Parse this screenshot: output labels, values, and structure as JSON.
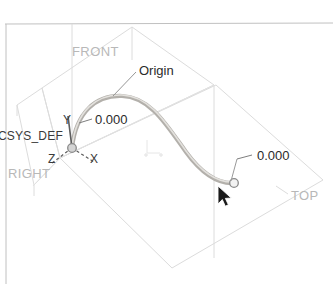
{
  "viewport": {
    "name": "cad-3d-viewport",
    "background_color": "#ffffff",
    "border_color": "#c9c9c9"
  },
  "colors": {
    "datum_plane_line": "#d8d8d8",
    "spline_curve": "#b3b0ab",
    "spline_highlight": "#d9d7d3",
    "leader_line": "#8f8f8f",
    "axis_line": "#6f6f6f",
    "point_marker_fill": "#d0d0d0",
    "point_marker_stroke": "#7a7a7a",
    "plane_label": "#b8b8b8",
    "dark_text": "#2b2b2b",
    "cursor": "#1a1a1a"
  },
  "datum_planes": [
    {
      "name": "FRONT",
      "label": "FRONT",
      "label_x": 72,
      "label_y": 44
    },
    {
      "name": "RIGHT",
      "label": "RIGHT",
      "label_x": 8,
      "label_y": 166
    },
    {
      "name": "TOP",
      "label": "TOP",
      "label_x": 291,
      "label_y": 188
    }
  ],
  "coordinate_system": {
    "name": "CSYS_DEF",
    "label": "CSYS_DEF",
    "label_x": -2,
    "label_y": 129,
    "origin_x": 72,
    "origin_y": 148,
    "axes": [
      {
        "name": "Y",
        "label": "Y",
        "label_x": 63,
        "label_y": 113
      },
      {
        "name": "Z",
        "label": "Z",
        "label_x": 48,
        "label_y": 152
      },
      {
        "name": "X",
        "label": "X",
        "label_x": 90,
        "label_y": 152
      }
    ]
  },
  "annotations": [
    {
      "name": "origin-annotation",
      "text": "Origin",
      "text_x": 139,
      "text_y": 63,
      "leader_from_x": 136,
      "leader_from_y": 72,
      "leader_to_x": 113,
      "leader_to_y": 95
    },
    {
      "name": "start-point-dimension",
      "text": "0.000",
      "text_x": 95,
      "text_y": 112,
      "leader_from_x": 92,
      "leader_from_y": 119,
      "leader_to_x": 79,
      "leader_to_y": 123
    },
    {
      "name": "end-point-dimension",
      "text": "0.000",
      "text_x": 257,
      "text_y": 148,
      "leader_from_x": 252,
      "leader_from_y": 155,
      "leader_to_x": 236,
      "leader_to_y": 158
    }
  ],
  "spline": {
    "name": "sketched-spline-curve",
    "start_point": {
      "x": 72,
      "y": 148,
      "value": "0.000"
    },
    "end_point": {
      "x": 234,
      "y": 183,
      "value": "0.000"
    },
    "path": "M 72 148 C 76 112, 96 95, 122 96 C 150 97, 166 124, 186 152 C 202 174, 218 184, 234 183"
  },
  "cursor": {
    "name": "mouse-pointer",
    "x": 218,
    "y": 186
  }
}
